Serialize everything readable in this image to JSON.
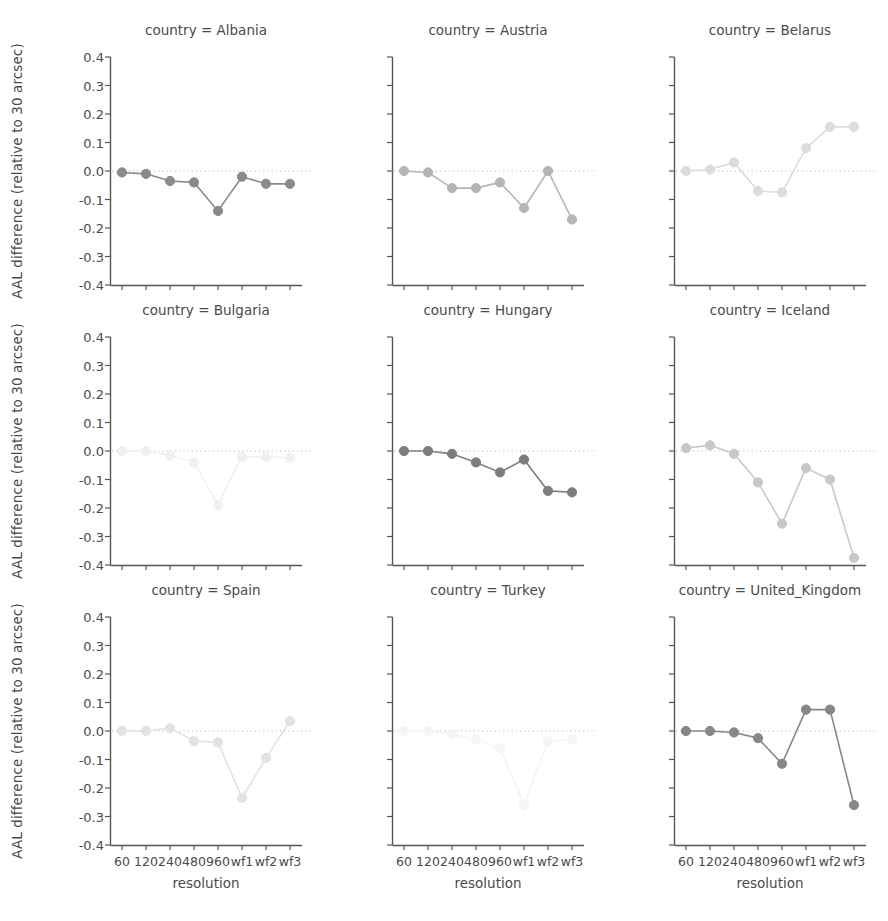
{
  "figure": {
    "ylabel": "AAL difference (relative to 30 arcsec)",
    "xlabel": "resolution",
    "title_prefix": "country = "
  },
  "axes": {
    "y_ticks": [
      "0.4",
      "0.3",
      "0.2",
      "0.1",
      "0.0",
      "-0.1",
      "-0.2",
      "-0.3",
      "-0.4"
    ],
    "y_tick_values": [
      0.4,
      0.3,
      0.2,
      0.1,
      0.0,
      -0.1,
      -0.2,
      -0.3,
      -0.4
    ],
    "x_ticks": [
      "60",
      "120",
      "240",
      "480",
      "960",
      "wf1",
      "wf2",
      "wf3"
    ],
    "ylim": [
      -0.4,
      0.4
    ],
    "grid": false,
    "zero_reference_line": true,
    "legend": "none"
  },
  "colors": {
    "axis": "#555555",
    "text": "#4a4a4a",
    "zero_line": "#b9b9b9",
    "background": "#ffffff"
  },
  "panel_titles": [
    "country = Albania",
    "country = Austria",
    "country = Belarus",
    "country = Bulgaria",
    "country = Hungary",
    "country = Iceland",
    "country = Spain",
    "country = Turkey",
    "country = United_Kingdom"
  ],
  "chart_data": {
    "type": "line",
    "xlabel": "resolution",
    "ylabel": "AAL difference (relative to 30 arcsec)",
    "x": [
      "60",
      "120",
      "240",
      "480",
      "960",
      "wf1",
      "wf2",
      "wf3"
    ],
    "ylim": [
      -0.4,
      0.4
    ],
    "ytick_values": [
      0.4,
      0.3,
      0.2,
      0.1,
      0.0,
      -0.1,
      -0.2,
      -0.3,
      -0.4
    ],
    "grid": false,
    "legend_position": "none",
    "facet_variable": "country",
    "facet_layout": [
      3,
      3
    ],
    "series": [
      {
        "name": "Albania",
        "values": [
          -0.005,
          -0.01,
          -0.035,
          -0.04,
          -0.14,
          -0.02,
          -0.045,
          -0.045
        ],
        "color": "#8a8a8a"
      },
      {
        "name": "Austria",
        "values": [
          0.0,
          -0.005,
          -0.06,
          -0.06,
          -0.04,
          -0.13,
          0.0,
          -0.17
        ],
        "color": "#b5b5b5"
      },
      {
        "name": "Belarus",
        "values": [
          0.0,
          0.005,
          0.03,
          -0.07,
          -0.075,
          0.08,
          0.155,
          0.155
        ],
        "color": "#dcdcdc"
      },
      {
        "name": "Bulgaria",
        "values": [
          0.0,
          0.0,
          -0.015,
          -0.04,
          -0.19,
          -0.02,
          -0.02,
          -0.025
        ],
        "color": "#f0f0f0"
      },
      {
        "name": "Hungary",
        "values": [
          0.0,
          0.0,
          -0.01,
          -0.04,
          -0.075,
          -0.03,
          -0.14,
          -0.145
        ],
        "color": "#7d7d7d"
      },
      {
        "name": "Iceland",
        "values": [
          0.01,
          0.02,
          -0.01,
          -0.11,
          -0.255,
          -0.06,
          -0.1,
          -0.375
        ],
        "color": "#c8c8c8"
      },
      {
        "name": "Spain",
        "values": [
          0.0,
          0.0,
          0.01,
          -0.035,
          -0.04,
          -0.235,
          -0.095,
          0.035
        ],
        "color": "#e2e2e2"
      },
      {
        "name": "Turkey",
        "values": [
          0.0,
          0.0,
          -0.01,
          -0.03,
          -0.06,
          -0.26,
          -0.035,
          -0.03
        ],
        "color": "#f4f4f4"
      },
      {
        "name": "United_Kingdom",
        "values": [
          0.0,
          0.0,
          -0.005,
          -0.025,
          -0.115,
          0.075,
          0.075,
          -0.26
        ],
        "color": "#878787"
      }
    ]
  }
}
